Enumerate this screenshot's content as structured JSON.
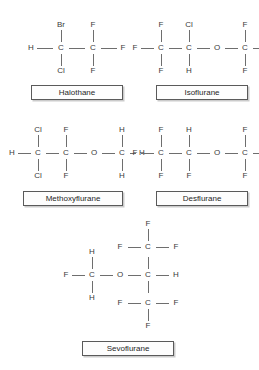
{
  "figure": {
    "title": "",
    "background": "#ffffff",
    "bond_color": "#6e6e6e",
    "atom_color": "#3a3a3a",
    "box_border_color": "#5a5a5a"
  },
  "molecules": [
    {
      "name": "halothane",
      "label": "Halothane",
      "formula_reading": "H-C(Br)(Cl)-C(F)(F)-F",
      "atoms": {
        "h_left": "H",
        "c1": "C",
        "c2": "C",
        "br_top": "Br",
        "cl_bottom": "Cl",
        "f_top": "F",
        "f_right": "F",
        "f_bottom": "F"
      }
    },
    {
      "name": "isoflurane",
      "label": "Isoflurane",
      "formula_reading": "F-C(F)(F)-C(Cl)(H)-O-C(F)(F)-H",
      "atoms": {
        "f_left": "F",
        "c1": "C",
        "c2": "C",
        "o": "O",
        "c3": "C",
        "f_top1": "F",
        "f_bottom1": "F",
        "cl_top": "Cl",
        "h_bottom": "H",
        "f_top3": "F",
        "f_bottom3": "F",
        "h_right": "H"
      }
    },
    {
      "name": "methoxyflurane",
      "label": "Methoxyflurane",
      "formula_reading": "H-C(Cl)(Cl)-C(F)(F)-O-C(H)(H)-H",
      "atoms": {
        "h_left": "H",
        "c1": "C",
        "c2": "C",
        "o": "O",
        "c3": "C",
        "cl_top": "Cl",
        "cl_bottom": "Cl",
        "f_top": "F",
        "f_bottom": "F",
        "h_top3": "H",
        "h_bottom3": "H",
        "h_right": "H"
      }
    },
    {
      "name": "desflurane",
      "label": "Desflurane",
      "formula_reading": "F-C(F)(F)-C(H)(F)-O-C(F)(F)-H",
      "atoms": {
        "f_left": "F",
        "c1": "C",
        "c2": "C",
        "o": "O",
        "c3": "C",
        "f_top1": "F",
        "f_bottom1": "F",
        "h_top2": "H",
        "f_bottom2": "F",
        "f_top3": "F",
        "f_bottom3": "F",
        "h_right": "H"
      }
    },
    {
      "name": "sevoflurane",
      "label": "Sevoflurane",
      "formula_reading": "F-C(H)(H)-O-C(H)(CF3)(CF3)",
      "atoms": {
        "f_left": "F",
        "c1": "C",
        "h_top1": "H",
        "h_bottom1": "H",
        "o": "O",
        "c2": "C",
        "h_right": "H",
        "c_up": "C",
        "f_up_left": "F",
        "f_up_right": "F",
        "f_up_top": "F",
        "c_down": "C",
        "f_down_left": "F",
        "f_down_right": "F",
        "f_down_bottom": "F"
      }
    }
  ]
}
